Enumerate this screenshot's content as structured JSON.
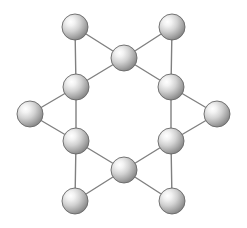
{
  "figure": {
    "background_color": "#ffffff",
    "canvas": {
      "width": 247,
      "height": 228
    }
  },
  "style": {
    "atom_radius": 13,
    "atom_highlight_color": "#ffffff",
    "atom_mid_color": "#c9c9c9",
    "atom_edge_color": "#8a8a8a",
    "atom_outline_color": "#666666",
    "bond_color": "#808080",
    "bond_width": 1.4,
    "highlight_offset": {
      "cx": "33%",
      "cy": "30%"
    }
  },
  "chart_data": {
    "type": "scatter",
    "xlabel": "",
    "ylabel": "",
    "xlim": [
      0,
      247
    ],
    "ylim": [
      0,
      228
    ],
    "grid": false,
    "legend": "none",
    "atoms": [
      {
        "id": "ring-top",
        "label": "ring-top",
        "group": "ring",
        "x": 124,
        "y": 58,
        "r": 13
      },
      {
        "id": "ring-upper-right",
        "label": "ring-upper-right",
        "group": "ring",
        "x": 171,
        "y": 87,
        "r": 13
      },
      {
        "id": "ring-lower-right",
        "label": "ring-lower-right",
        "group": "ring",
        "x": 171,
        "y": 141,
        "r": 13
      },
      {
        "id": "ring-bottom",
        "label": "ring-bottom",
        "group": "ring",
        "x": 124,
        "y": 170,
        "r": 13
      },
      {
        "id": "ring-lower-left",
        "label": "ring-lower-left",
        "group": "ring",
        "x": 76,
        "y": 141,
        "r": 13
      },
      {
        "id": "ring-upper-left",
        "label": "ring-upper-left",
        "group": "ring",
        "x": 76,
        "y": 87,
        "r": 13
      },
      {
        "id": "apex-top-left",
        "label": "apex-top-left",
        "group": "apex",
        "x": 75,
        "y": 27,
        "r": 13
      },
      {
        "id": "apex-top-right",
        "label": "apex-top-right",
        "group": "apex",
        "x": 172,
        "y": 27,
        "r": 13
      },
      {
        "id": "apex-right",
        "label": "apex-right",
        "group": "apex",
        "x": 217,
        "y": 114,
        "r": 13
      },
      {
        "id": "apex-bottom-right",
        "label": "apex-bottom-right",
        "group": "apex",
        "x": 172,
        "y": 201,
        "r": 13
      },
      {
        "id": "apex-bottom-left",
        "label": "apex-bottom-left",
        "group": "apex",
        "x": 75,
        "y": 201,
        "r": 13
      },
      {
        "id": "apex-left",
        "label": "apex-left",
        "group": "apex",
        "x": 30,
        "y": 114,
        "r": 13
      }
    ],
    "bonds": [
      {
        "from": "ring-upper-left",
        "to": "ring-top",
        "kind": "ring"
      },
      {
        "from": "ring-top",
        "to": "ring-upper-right",
        "kind": "ring"
      },
      {
        "from": "ring-upper-right",
        "to": "ring-lower-right",
        "kind": "ring"
      },
      {
        "from": "ring-lower-right",
        "to": "ring-bottom",
        "kind": "ring"
      },
      {
        "from": "ring-bottom",
        "to": "ring-lower-left",
        "kind": "ring"
      },
      {
        "from": "ring-lower-left",
        "to": "ring-upper-left",
        "kind": "ring"
      },
      {
        "from": "apex-top-left",
        "to": "ring-upper-left",
        "kind": "apex"
      },
      {
        "from": "apex-top-left",
        "to": "ring-top",
        "kind": "apex"
      },
      {
        "from": "apex-top-right",
        "to": "ring-top",
        "kind": "apex"
      },
      {
        "from": "apex-top-right",
        "to": "ring-upper-right",
        "kind": "apex"
      },
      {
        "from": "apex-right",
        "to": "ring-upper-right",
        "kind": "apex"
      },
      {
        "from": "apex-right",
        "to": "ring-lower-right",
        "kind": "apex"
      },
      {
        "from": "apex-bottom-right",
        "to": "ring-lower-right",
        "kind": "apex"
      },
      {
        "from": "apex-bottom-right",
        "to": "ring-bottom",
        "kind": "apex"
      },
      {
        "from": "apex-bottom-left",
        "to": "ring-bottom",
        "kind": "apex"
      },
      {
        "from": "apex-bottom-left",
        "to": "ring-lower-left",
        "kind": "apex"
      },
      {
        "from": "apex-left",
        "to": "ring-lower-left",
        "kind": "apex"
      },
      {
        "from": "apex-left",
        "to": "ring-upper-left",
        "kind": "apex"
      }
    ]
  }
}
